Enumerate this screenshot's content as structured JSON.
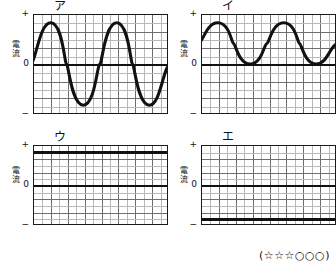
{
  "figure": {
    "axis_label_vertical": [
      "電",
      "流"
    ],
    "tick_plus": "+",
    "tick_zero": "0",
    "tick_minus": "−",
    "rating": "(☆☆☆○○○)",
    "grid": {
      "columns": 16,
      "rows": 12,
      "major_every": 2,
      "visible": true
    },
    "line_color": "#111111",
    "grid_color": "#b9b9b9",
    "grid_major_color": "#6e6e6e"
  },
  "panels": [
    {
      "label": "ア",
      "type": "sine-ac",
      "description": "alternating current sine wave, 2 cycles, symmetric about zero",
      "cycles": 2,
      "amplitude_level": "+",
      "min_level": "−"
    },
    {
      "label": "イ",
      "type": "pulsating-positive",
      "description": "rectified pulsating wave, 2 cycles, oscillates between 0 and +",
      "cycles": 2,
      "amplitude_level": "+",
      "min_level": "0"
    },
    {
      "label": "ウ",
      "type": "dc-positive",
      "description": "constant direct current held at + level",
      "cycles": 0,
      "amplitude_level": "+",
      "min_level": "+"
    },
    {
      "label": "エ",
      "type": "dc-negative",
      "description": "constant direct current held at − level",
      "cycles": 0,
      "amplitude_level": "−",
      "min_level": "−"
    }
  ],
  "chart_data": {
    "type": "line",
    "title": "",
    "xlabel": "",
    "ylabel": "電流",
    "ylim": [
      -1,
      1
    ],
    "ytick_labels": [
      "+",
      "0",
      "−"
    ],
    "ytick_values": [
      1,
      0,
      -1
    ],
    "grid": true,
    "legend_position": "none",
    "subplots": [
      {
        "name": "ア",
        "waveform": "sine",
        "x": [
          0,
          0.125,
          0.25,
          0.375,
          0.5,
          0.625,
          0.75,
          0.875,
          1.0
        ],
        "y": [
          0,
          0.92,
          0,
          -0.92,
          0,
          0.92,
          0,
          -0.92,
          0
        ]
      },
      {
        "name": "イ",
        "waveform": "pulsating-positive",
        "x": [
          0,
          0.125,
          0.25,
          0.375,
          0.5,
          0.625,
          0.75,
          0.875,
          1.0
        ],
        "y": [
          0.46,
          0.92,
          0.46,
          0,
          0.46,
          0.92,
          0.46,
          0,
          0.46
        ]
      },
      {
        "name": "ウ",
        "waveform": "constant",
        "x": [
          0,
          1.0
        ],
        "y": [
          0.92,
          0.92
        ]
      },
      {
        "name": "エ",
        "waveform": "constant",
        "x": [
          0,
          1.0
        ],
        "y": [
          -0.92,
          -0.92
        ]
      }
    ]
  }
}
